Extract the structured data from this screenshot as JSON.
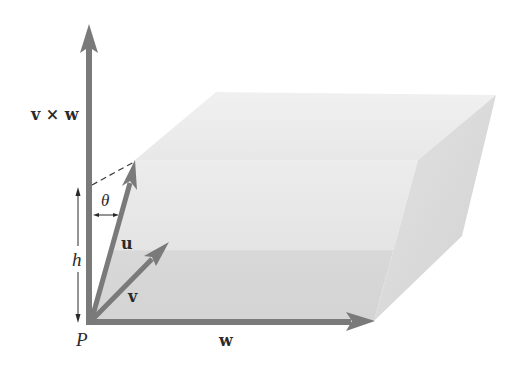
{
  "figure": {
    "colors": {
      "background": "#ffffff",
      "arrow": "#7a7a7a",
      "top_face": "#eeeeee",
      "front_face_upper": "#e6e6e6",
      "front_face_lower": "#d9d9d9",
      "right_face": "#dcdcdc",
      "label": "#2a2a2a",
      "dashed": "#3a3a3a"
    },
    "labels": {
      "cross_product": "v × w",
      "u": "u",
      "v": "v",
      "w": "w",
      "theta": "θ",
      "height": "h",
      "origin": "P"
    },
    "vectors": [
      {
        "name": "v × w",
        "from": [
          89,
          323
        ],
        "to": [
          89,
          25
        ]
      },
      {
        "name": "u",
        "from": [
          89,
          323
        ],
        "to": [
          135,
          160
        ]
      },
      {
        "name": "v",
        "from": [
          89,
          323
        ],
        "to": [
          168,
          243
        ]
      },
      {
        "name": "w",
        "from": [
          89,
          323
        ],
        "to": [
          374,
          321
        ]
      }
    ]
  }
}
